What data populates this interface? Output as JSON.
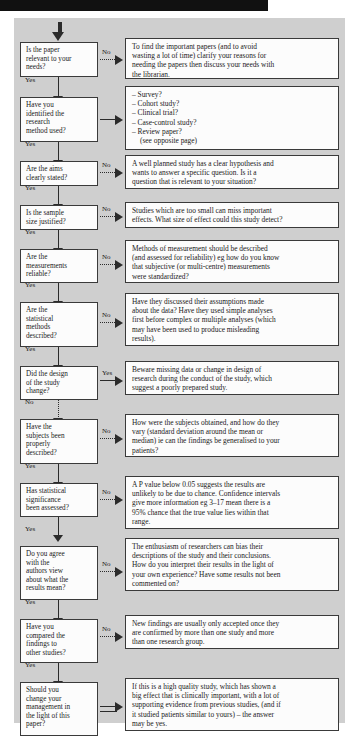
{
  "page": {
    "background_color": "#ffffff",
    "chart_background_color": "#cfcfcf",
    "box_fill_color": "#fcfcfc",
    "line_color": "#2b2b2b",
    "top_bar_color": "#111111"
  },
  "flow": {
    "entry_label": "",
    "steps": [
      {
        "id": "relevance",
        "question": [
          "Is the paper",
          "relevant to your",
          "needs?"
        ],
        "branch_label": "No",
        "branch_style": "dotted",
        "answer": [
          "To find the important papers (and to avoid",
          "wasting a lot of time) clarify your reasons for",
          "needing the papers then discuss your needs with",
          "the librarian."
        ],
        "next_label": "Yes",
        "next_style": "solid"
      },
      {
        "id": "method",
        "question": [
          "Have you",
          "identified the",
          "research",
          "method used?"
        ],
        "branch_label": "",
        "branch_style": "solid",
        "answer": [
          "– Survey?",
          "– Cohort study?",
          "– Clinical trial?",
          "– Case-control study?",
          "– Review paper?",
          "(see opposite page)"
        ],
        "next_label": "Yes",
        "next_style": "solid"
      },
      {
        "id": "aims",
        "question": [
          "Are the aims",
          "clearly stated?"
        ],
        "branch_label": "No",
        "branch_style": "dotted",
        "answer": [
          "A well planned study has a clear hypothesis and",
          "wants to answer a specific question. Is it a",
          "question that is relevant to your situation?"
        ],
        "next_label": "Yes",
        "next_style": "solid"
      },
      {
        "id": "sample-size",
        "question": [
          "Is the sample",
          "size justified?"
        ],
        "branch_label": "No",
        "branch_style": "dotted",
        "answer": [
          "Studies which are too small can miss important",
          "effects. What size of effect could this study detect?"
        ],
        "next_label": "Yes",
        "next_style": "solid"
      },
      {
        "id": "measurements",
        "question": [
          "Are the",
          "measurements",
          "reliable?"
        ],
        "branch_label": "No",
        "branch_style": "dotted",
        "answer": [
          "Methods of measurement should be described",
          "(and assessed for reliability) eg how do you know",
          "that subjective (or multi-centre) measurements",
          "were standardized?"
        ],
        "next_label": "Yes",
        "next_style": "solid"
      },
      {
        "id": "statistical-methods",
        "question": [
          "Are the",
          "statistical",
          "methods",
          "described?"
        ],
        "branch_label": "No",
        "branch_style": "dotted",
        "answer": [
          "Have they discussed their assumptions made",
          "about the data? Have they used simple analyses",
          "first before complex or multiple analyses (which",
          "may have been used to produce misleading",
          "results)."
        ],
        "next_label": "Yes",
        "next_style": "solid"
      },
      {
        "id": "design-change",
        "question": [
          "Did the design",
          "of the study",
          "change?"
        ],
        "branch_label": "Yes",
        "branch_style": "solid",
        "answer": [
          "Beware missing data or change in design of",
          "research during the conduct of the study, which",
          "suggest a poorly prepared study."
        ],
        "next_label": "No",
        "next_style": "dotted"
      },
      {
        "id": "subjects-described",
        "question": [
          "Have the",
          "subjects been",
          "properly",
          "described?"
        ],
        "branch_label": "No",
        "branch_style": "dotted",
        "answer": [
          "How were the subjects obtained, and how do they",
          "vary (standard deviation around the mean or",
          "median) ie can the findings be generalised to your",
          "patients?"
        ],
        "next_label": "Yes",
        "next_style": "solid"
      },
      {
        "id": "significance",
        "question": [
          "Has statistical",
          "significance",
          "been assessed?"
        ],
        "branch_label": "No",
        "branch_style": "dotted",
        "answer": [
          "A P value below 0.05 suggests the results are",
          "unlikely to be due to chance. Confidence intervals",
          "give more information eg 3–17 mean there is a",
          "95% chance that the true value lies within that",
          "range."
        ],
        "next_label": "Yes",
        "next_style": "solid"
      },
      {
        "id": "authors-view",
        "question": [
          "Do you agree",
          "with the",
          "authors view",
          "about what the",
          "results mean?"
        ],
        "branch_label": "No",
        "branch_style": "dotted",
        "answer": [
          "The enthusiasm of researchers can bias their",
          "descriptions of the study and their conclusions.",
          "How do you interpret their results in the light of",
          "your own experience? Have some results not been",
          "commented on?"
        ],
        "next_label": "Yes",
        "next_style": "solid"
      },
      {
        "id": "compared-findings",
        "question": [
          "Have you",
          "compared the",
          "findings to",
          "other studies?"
        ],
        "branch_label": "No",
        "branch_style": "dotted",
        "answer": [
          "New findings are usually only accepted once they",
          "are confirmed by more than one study and more",
          "than one research group."
        ],
        "next_label": "Yes",
        "next_style": "solid"
      },
      {
        "id": "change-management",
        "question": [
          "Should you",
          "change your",
          "management in",
          "the light of this",
          "paper?"
        ],
        "branch_label": "",
        "branch_style": "double",
        "answer": [
          "If this is a high quality study, which has shown a",
          "big effect that is clinically important, with a lot of",
          "supporting evidence from previous studies, (and if",
          "it studied patients similar to yours) – the answer",
          "may be yes."
        ],
        "next_label": "",
        "next_style": "none"
      }
    ]
  }
}
